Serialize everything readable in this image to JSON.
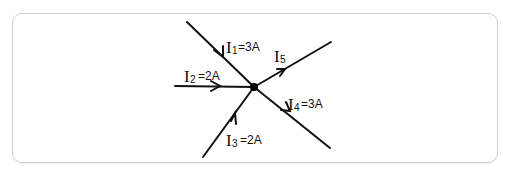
{
  "diagram": {
    "type": "kirchhoff-current-junction",
    "node": {
      "x": 254,
      "y": 87
    },
    "branches": [
      {
        "id": "I1",
        "letter": "I",
        "sub": "1",
        "value": "=3A",
        "direction": "into-node"
      },
      {
        "id": "I2",
        "letter": "I",
        "sub": "2",
        "value": "=2A",
        "direction": "into-node"
      },
      {
        "id": "I3",
        "letter": "I",
        "sub": "3",
        "value": "=2A",
        "direction": "into-node"
      },
      {
        "id": "I4",
        "letter": "I",
        "sub": "4",
        "value": "=3A",
        "direction": "out-of-node"
      },
      {
        "id": "I5",
        "letter": "I",
        "sub": "5",
        "value": "",
        "direction": "out-of-node"
      }
    ],
    "colors": {
      "line": "#111111",
      "frame": "#cfcfcf",
      "background": "#ffffff"
    }
  }
}
